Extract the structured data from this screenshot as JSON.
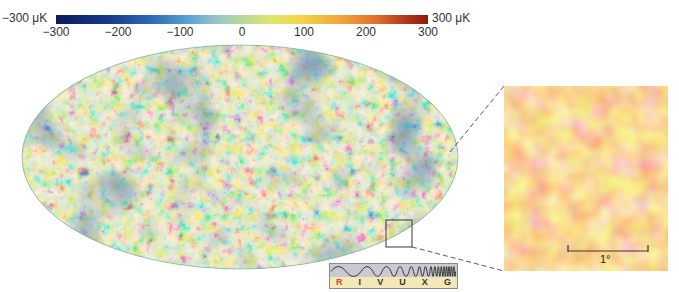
{
  "figure": {
    "colorbar": {
      "min_label": "−300 μK",
      "max_label": "300 μK",
      "ticks": [
        "−300",
        "−200",
        "−100",
        "0",
        "100",
        "200",
        "300"
      ],
      "tick_values": [
        -300,
        -200,
        -100,
        0,
        100,
        200,
        300
      ],
      "range": [
        -300,
        300
      ],
      "unit": "μK",
      "colors": [
        "#0b1a5c",
        "#2d6bb5",
        "#9cc9c4",
        "#dfe46a",
        "#f2a83a",
        "#b3361b"
      ]
    },
    "sky_map": {
      "projection": "Mollweide (all-sky ellipse)",
      "highlight_box": "zoom region near lower-right edge"
    },
    "inset": {
      "description": "Magnified patch of the sky map",
      "scale_bar_label": "1°",
      "colors": [
        "#fbf4b0",
        "#f5c66a",
        "#e98a3c",
        "#d8452b"
      ]
    },
    "spectrum_strip": {
      "bands": [
        "R",
        "I",
        "V",
        "U",
        "X",
        "G"
      ],
      "highlighted_band": "R",
      "highlight_color": "#d8452b"
    }
  }
}
